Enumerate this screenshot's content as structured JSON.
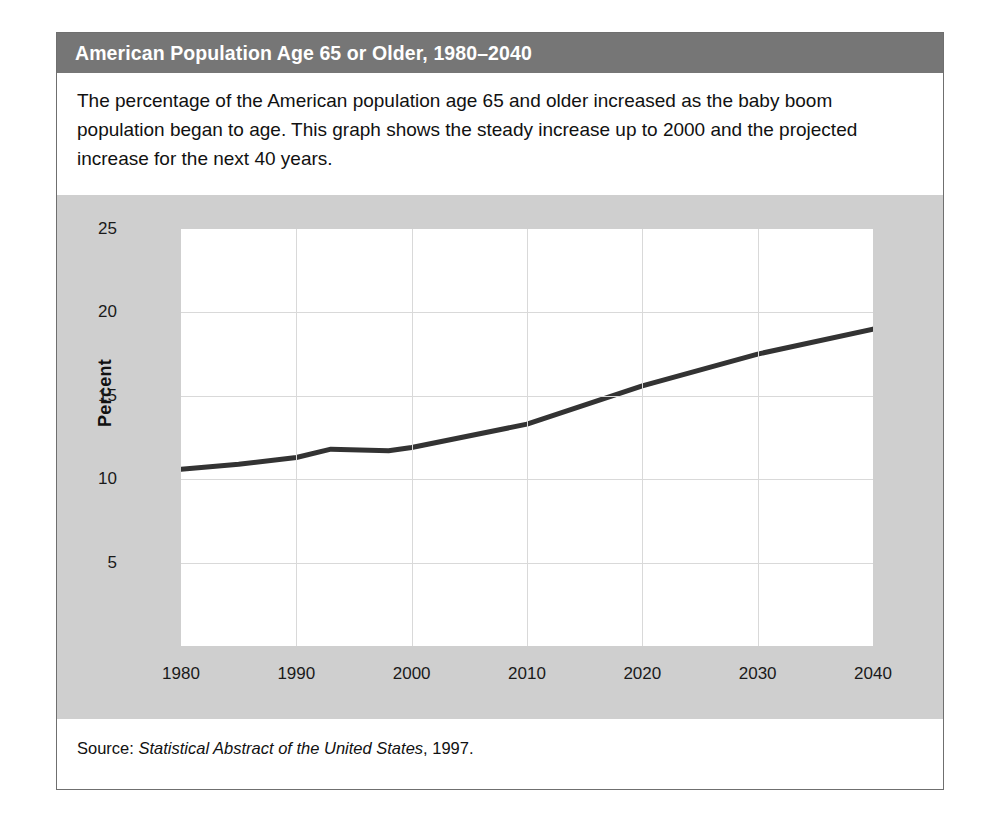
{
  "figure": {
    "title": "American Population Age 65 or Older, 1980–2040",
    "caption": "The percentage of the American population age 65 and older increased as the baby boom population began to age. This graph shows the steady increase up to 2000 and the projected increase for the next 40 years.",
    "source_prefix": "Source: ",
    "source_italic": "Statistical Abstract of the United States",
    "source_suffix": ", 1997.",
    "colors": {
      "title_bar": "#767676",
      "title_text": "#ffffff",
      "chart_panel": "#cfcfcf",
      "plot_background": "#ffffff",
      "gridline": "#d9d9d9",
      "series_line": "#333333",
      "frame_border": "#6f6f6f"
    }
  },
  "chart_data": {
    "type": "line",
    "title": "American Population Age 65 or Older, 1980–2040",
    "xlabel": "",
    "ylabel": "Percent",
    "xlim": [
      1980,
      2040
    ],
    "ylim": [
      0,
      25
    ],
    "xticks": [
      1980,
      1990,
      2000,
      2010,
      2020,
      2030,
      2040
    ],
    "xtick_labels": [
      "1980",
      "1990",
      "2000",
      "2010",
      "2020",
      "2030",
      "2040"
    ],
    "yticks": [
      5,
      10,
      15,
      20,
      25
    ],
    "ytick_labels": [
      "5",
      "10",
      "15",
      "20",
      "25"
    ],
    "grid": true,
    "legend": false,
    "series": [
      {
        "name": "Percent age 65 or older",
        "x": [
          1980,
          1985,
          1990,
          1993,
          1998,
          2000,
          2010,
          2020,
          2030,
          2040
        ],
        "values": [
          10.6,
          10.9,
          11.3,
          11.8,
          11.7,
          11.9,
          13.3,
          15.6,
          17.5,
          19.0
        ]
      }
    ]
  }
}
